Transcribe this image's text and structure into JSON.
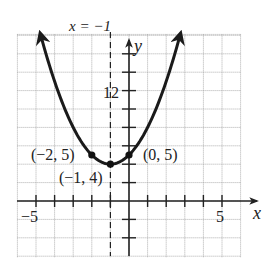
{
  "chart_data": {
    "type": "line",
    "title": "",
    "function": "y = (x + 1)^2 + 4",
    "xlabel": "x",
    "ylabel": "y",
    "xlim": [
      -6,
      6
    ],
    "ylim": [
      -6,
      18
    ],
    "x_tick_step": 1,
    "y_tick_step": 2,
    "x_tick_labels": [
      {
        "value": -5,
        "label": "−5"
      },
      {
        "value": 5,
        "label": "5"
      }
    ],
    "y_tick_labels": [
      {
        "value": 12,
        "label": "12"
      }
    ],
    "grid": true,
    "asymptote_or_axis_of_symmetry": {
      "label": "x = −1",
      "x": -1,
      "style": "dashed"
    },
    "points": [
      {
        "x": -2,
        "y": 5,
        "label": "(−2, 5)"
      },
      {
        "x": -1,
        "y": 4,
        "label": "(−1, 4)"
      },
      {
        "x": 0,
        "y": 5,
        "label": "(0, 5)"
      }
    ],
    "series": [
      {
        "name": "parabola",
        "x_range": [
          -4.74,
          2.74
        ],
        "vertex": [
          -1,
          4
        ],
        "a": 1,
        "arrows_both_ends": true
      }
    ]
  },
  "labels": {
    "x_axis": "x",
    "y_axis": "y",
    "axis_of_symmetry_prefix": "x",
    "axis_of_symmetry": "x = −1",
    "tick_neg5": "−5",
    "tick_5": "5",
    "tick_12": "12",
    "pt_left": "(−2, 5)",
    "pt_vertex": "(−1, 4)",
    "pt_right": "(0, 5)"
  }
}
